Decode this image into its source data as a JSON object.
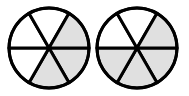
{
  "diagram": {
    "type": "fraction-circles",
    "colors": {
      "shade": "#e0e0e0",
      "stroke": "#000000",
      "background": "#ffffff"
    },
    "circles": [
      {
        "id": "circle-1",
        "cx": 49,
        "cy": 48,
        "r": 40,
        "sectors": 6,
        "shaded_sectors": [
          0,
          1,
          5
        ],
        "shaded_count": 3
      },
      {
        "id": "circle-2",
        "cx": 137,
        "cy": 48,
        "r": 40,
        "sectors": 6,
        "shaded_sectors": [
          0,
          1,
          2,
          5
        ],
        "shaded_count": 4
      }
    ]
  }
}
